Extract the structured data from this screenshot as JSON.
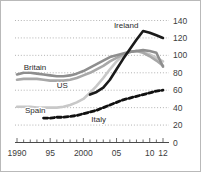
{
  "chart_data": {
    "type": "line",
    "title": "",
    "subtitle": "",
    "xlabel": "",
    "ylabel": "",
    "xlim": [
      1990,
      2012
    ],
    "ylim": [
      0,
      140
    ],
    "y_ticks": [
      0,
      20,
      40,
      60,
      80,
      100,
      120,
      140
    ],
    "y_tick_labels": [
      "0",
      "20",
      "40",
      "60",
      "80",
      "100",
      "120",
      "140"
    ],
    "x_ticks": [
      1990,
      1995,
      2000,
      2005,
      2010,
      2012
    ],
    "x_tick_labels": [
      "1990",
      "95",
      "2000",
      "05",
      "10",
      "12"
    ],
    "grid": true,
    "legend_position": "inline-annotations",
    "series": [
      {
        "name": "Ireland",
        "color": "#1a1a1a",
        "style": "solid",
        "width": 2.6,
        "label_x": 2004.6,
        "label_y": 131,
        "x": [
          2001,
          2002,
          2003,
          2004,
          2005,
          2006,
          2007,
          2008,
          2009,
          2010,
          2011,
          2012
        ],
        "values": [
          55,
          58,
          63,
          72,
          84,
          96,
          107,
          118,
          128,
          126,
          123,
          120
        ]
      },
      {
        "name": "Britain",
        "color": "#8e8e8e",
        "style": "solid",
        "width": 2.6,
        "label_x": 1991.0,
        "label_y": 83,
        "x": [
          1990,
          1991,
          1992,
          1993,
          1994,
          1995,
          1996,
          1997,
          1998,
          1999,
          2000,
          2001,
          2002,
          2003,
          2004,
          2005,
          2006,
          2007,
          2008,
          2009,
          2010,
          2011,
          2012
        ],
        "values": [
          78,
          80,
          80,
          79,
          78,
          77,
          76,
          76,
          77,
          79,
          82,
          86,
          90,
          94,
          98,
          100,
          102,
          104,
          105,
          106,
          105,
          103,
          87
        ]
      },
      {
        "name": "US",
        "color": "#a8a8a8",
        "style": "solid",
        "width": 2.6,
        "label_x": 1996.0,
        "label_y": 62,
        "x": [
          1990,
          1991,
          1992,
          1993,
          1994,
          1995,
          1996,
          1997,
          1998,
          1999,
          2000,
          2001,
          2002,
          2003,
          2004,
          2005,
          2006,
          2007,
          2008,
          2009,
          2010,
          2011,
          2012
        ],
        "values": [
          72,
          73,
          73,
          73,
          72,
          71,
          71,
          71,
          72,
          74,
          77,
          80,
          84,
          88,
          93,
          97,
          101,
          104,
          105,
          103,
          99,
          94,
          88
        ]
      },
      {
        "name": "Spain",
        "color": "#c8c8c8",
        "style": "solid",
        "width": 2.6,
        "label_x": 1991.2,
        "label_y": 34,
        "x": [
          1990,
          1991,
          1992,
          1993,
          1994,
          1995,
          1996,
          1997,
          1998,
          1999,
          2000,
          2001,
          2002,
          2003,
          2004,
          2005,
          2006,
          2007,
          2008,
          2009,
          2010,
          2011,
          2012
        ],
        "values": [
          41,
          41,
          41,
          40,
          40,
          40,
          40,
          41,
          43,
          46,
          50,
          57,
          65,
          74,
          84,
          93,
          100,
          104,
          105,
          104,
          101,
          97,
          93
        ]
      },
      {
        "name": "Italy",
        "color": "#111111",
        "style": "dashed",
        "width": 2.8,
        "label_x": 2001.2,
        "label_y": 24,
        "x": [
          1994,
          1995,
          1996,
          1997,
          1998,
          1999,
          2000,
          2001,
          2002,
          2003,
          2004,
          2005,
          2006,
          2007,
          2008,
          2009,
          2010,
          2011,
          2012
        ],
        "values": [
          28,
          28,
          29,
          29,
          30,
          31,
          33,
          35,
          37,
          40,
          43,
          46,
          49,
          51,
          53,
          55,
          57,
          59,
          60
        ]
      }
    ]
  }
}
